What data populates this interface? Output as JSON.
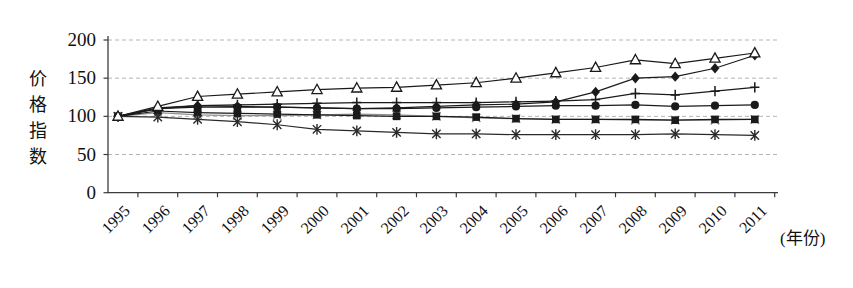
{
  "figure": {
    "y_axis_title": "价格指数",
    "x_axis_unit_label": "(年份)",
    "background_color": "#ffffff",
    "axis_color": "#3c3c3c",
    "grid_color": "#b5b5b5",
    "default_line_color": "#1a1a1a"
  },
  "chart_data": {
    "type": "line",
    "title": "",
    "ylabel": "价格指数",
    "xlabel": "(年份)",
    "categories": [
      "1995",
      "1996",
      "1997",
      "1998",
      "1999",
      "2000",
      "2001",
      "2002",
      "2003",
      "2004",
      "2005",
      "2006",
      "2007",
      "2008",
      "2009",
      "2010",
      "2011"
    ],
    "ylim": [
      0,
      200
    ],
    "yticks": [
      0,
      50,
      100,
      150,
      200
    ],
    "grid": "horizontal-dashed",
    "legend": "none",
    "series": [
      {
        "name": "series-x-cross",
        "marker": "x",
        "color": "#8f8f8f",
        "values": [
          100,
          105,
          102,
          101,
          101,
          102,
          103,
          102,
          100,
          98,
          97,
          96,
          96,
          95,
          95,
          95,
          96
        ]
      },
      {
        "name": "series-filled-square",
        "marker": "square",
        "color": "#1a1a1a",
        "values": [
          100,
          107,
          105,
          104,
          103,
          102,
          101,
          100,
          100,
          99,
          97,
          96,
          96,
          96,
          95,
          96,
          96
        ]
      },
      {
        "name": "series-filled-circle",
        "marker": "circle",
        "color": "#1a1a1a",
        "values": [
          100,
          110,
          112,
          112,
          112,
          111,
          110,
          110,
          111,
          112,
          113,
          114,
          114,
          115,
          113,
          114,
          115
        ]
      },
      {
        "name": "series-plus",
        "marker": "plus",
        "color": "#1a1a1a",
        "values": [
          100,
          110,
          114,
          115,
          116,
          117,
          118,
          118,
          118,
          118,
          119,
          120,
          122,
          130,
          128,
          133,
          138
        ]
      },
      {
        "name": "series-asterisk",
        "marker": "asterisk",
        "color": "#2a2a2a",
        "values": [
          100,
          99,
          96,
          93,
          89,
          83,
          81,
          79,
          77,
          77,
          76,
          76,
          76,
          76,
          77,
          76,
          75
        ]
      },
      {
        "name": "series-filled-diamond",
        "marker": "diamond",
        "color": "#1a1a1a",
        "values": [
          100,
          111,
          114,
          113,
          112,
          111,
          110,
          111,
          113,
          115,
          116,
          119,
          132,
          150,
          152,
          163,
          180
        ]
      },
      {
        "name": "series-open-triangle",
        "marker": "triangle-open",
        "color": "#1a1a1a",
        "values": [
          100,
          113,
          126,
          129,
          132,
          135,
          137,
          138,
          141,
          144,
          150,
          157,
          164,
          174,
          169,
          176,
          183
        ]
      }
    ]
  }
}
